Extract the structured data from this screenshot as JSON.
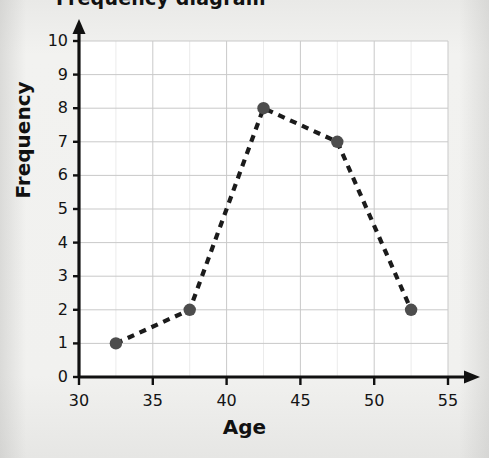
{
  "title": {
    "text": "Frequency diagram",
    "visible_state": "cropped-at-top"
  },
  "chart_data": {
    "type": "line",
    "title": "Frequency diagram",
    "xlabel": "Age",
    "ylabel": "Frequency",
    "xlim": [
      30,
      55
    ],
    "ylim": [
      0,
      10
    ],
    "xticks": [
      30,
      35,
      40,
      45,
      50,
      55
    ],
    "yticks": [
      0,
      1,
      2,
      3,
      4,
      5,
      6,
      7,
      8,
      9,
      10
    ],
    "xtick_labels": [
      "30",
      "35",
      "40",
      "45",
      "50",
      "55"
    ],
    "ytick_labels": [
      "0",
      "1",
      "2",
      "3",
      "4",
      "5",
      "6",
      "7",
      "8",
      "9",
      "10"
    ],
    "grid": true,
    "grid_minor_step_x": 2.5,
    "grid_minor_step_y": 0.5,
    "legend": false,
    "linestyle": "dashed",
    "marker": "circle",
    "x": [
      32.5,
      37.5,
      42.5,
      47.5,
      52.5
    ],
    "values": [
      1,
      2,
      8,
      7,
      2
    ],
    "points": [
      {
        "x": 32.5,
        "y": 1
      },
      {
        "x": 37.5,
        "y": 2
      },
      {
        "x": 42.5,
        "y": 8
      },
      {
        "x": 47.5,
        "y": 7
      },
      {
        "x": 52.5,
        "y": 2
      }
    ],
    "colors": {
      "line": "#1b1b1b",
      "marker": "#4d4d4d",
      "axis": "#111111",
      "grid_major": "#c9c9c9",
      "grid_minor": "#ebebeb",
      "plot_background": "#ffffff",
      "page_background": "#efefed"
    }
  }
}
